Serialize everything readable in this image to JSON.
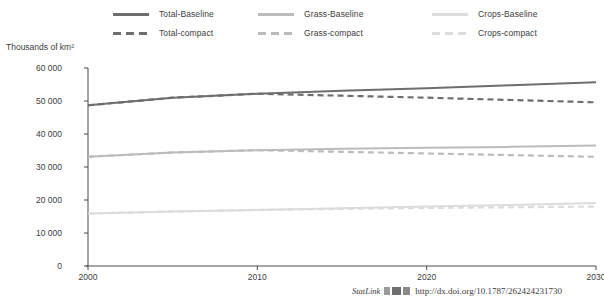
{
  "chart_data": {
    "type": "line",
    "title": "",
    "xlabel": "",
    "ylabel": "Thousands of km²",
    "xlim": [
      2000,
      2030
    ],
    "ylim": [
      0,
      60000
    ],
    "ytick_labels": [
      "0",
      "10 000",
      "20 000",
      "30 000",
      "40 000",
      "50 000",
      "60 000"
    ],
    "ytick_values": [
      0,
      10000,
      20000,
      30000,
      40000,
      50000,
      60000
    ],
    "xtick_labels": [
      "2000",
      "2010",
      "2020",
      "2030"
    ],
    "xtick_values": [
      2000,
      2010,
      2020,
      2030
    ],
    "grid": false,
    "legend_position": "top",
    "x": [
      2000,
      2005,
      2010,
      2015,
      2020,
      2025,
      2030
    ],
    "series": [
      {
        "name": "Total-Baseline",
        "style": "solid",
        "color": "#6e6e6e",
        "values": [
          48700,
          51000,
          52200,
          53100,
          53900,
          54800,
          55700
        ]
      },
      {
        "name": "Total-compact",
        "style": "dashed",
        "color": "#6e6e6e",
        "values": [
          48700,
          51000,
          52200,
          51600,
          51000,
          50300,
          49600
        ]
      },
      {
        "name": "Grass-Baseline",
        "style": "solid",
        "color": "#bcbcbc",
        "values": [
          33100,
          34400,
          35100,
          35500,
          35800,
          36100,
          36500
        ]
      },
      {
        "name": "Grass-compact",
        "style": "dashed",
        "color": "#bcbcbc",
        "values": [
          33100,
          34400,
          35100,
          34600,
          34100,
          33600,
          33100
        ]
      },
      {
        "name": "Crops-Baseline",
        "style": "solid",
        "color": "#dcdcdc",
        "values": [
          15900,
          16500,
          17000,
          17500,
          18000,
          18500,
          19100
        ]
      },
      {
        "name": "Crops-compact",
        "style": "dashed",
        "color": "#dcdcdc",
        "values": [
          15900,
          16500,
          17000,
          17300,
          17600,
          17800,
          18000
        ]
      }
    ]
  },
  "legend": {
    "columns": [
      [
        {
          "label": "Total-Baseline",
          "style": "solid",
          "color": "#6e6e6e"
        },
        {
          "label": "Total-compact",
          "style": "dashed",
          "color": "#6e6e6e"
        }
      ],
      [
        {
          "label": "Grass-Baseline",
          "style": "solid",
          "color": "#bcbcbc"
        },
        {
          "label": "Grass-compact",
          "style": "dashed",
          "color": "#bcbcbc"
        }
      ],
      [
        {
          "label": "Crops-Baseline",
          "style": "solid",
          "color": "#dcdcdc"
        },
        {
          "label": "Crops-compact",
          "style": "dashed",
          "color": "#dcdcdc"
        }
      ]
    ]
  },
  "footer": {
    "statlink_label": "StatLink",
    "statlink_url": "http://dx.doi.org/10.1787/262424231730"
  },
  "colors": {
    "axis": "#4a4a4a",
    "text": "#3d3d3d",
    "total": "#6e6e6e",
    "grass": "#bcbcbc",
    "crops": "#dcdcdc"
  }
}
